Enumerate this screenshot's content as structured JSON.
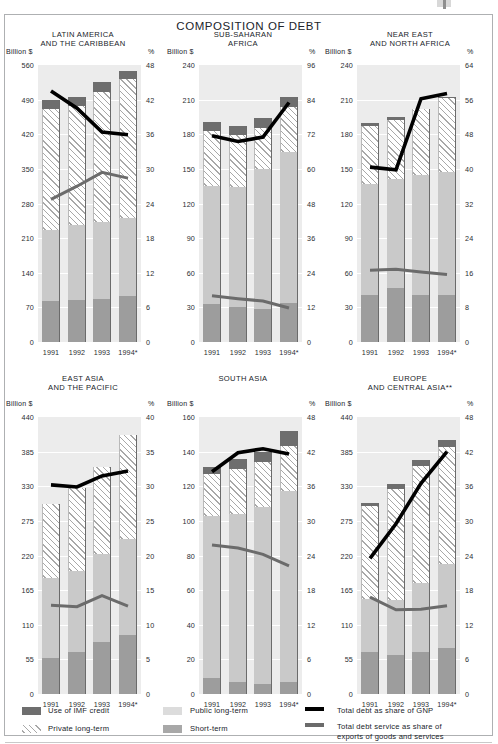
{
  "document": {
    "title": "COMPOSITION OF DEBT"
  },
  "legend": {
    "items": [
      {
        "key": "imf",
        "label": "Use of IMF credit",
        "swatch": "imf-swatch"
      },
      {
        "key": "priv",
        "label": "Private long-term",
        "swatch": "private-longterm-swatch"
      },
      {
        "key": "pub",
        "label": "Public long-term",
        "swatch": "public-longterm-swatch"
      },
      {
        "key": "srt",
        "label": "Short-term",
        "swatch": "short-term-swatch"
      },
      {
        "key": "gnp",
        "label": "Total debt as share of GNP",
        "swatch": "black-line-swatch"
      },
      {
        "key": "svc",
        "label": "Total debt service as share of",
        "label2": "exports of goods and services",
        "swatch": "gray-line-swatch"
      }
    ]
  },
  "axis_titles": {
    "left": "Billion $",
    "right": "%"
  },
  "colors": {
    "imf": "#6e6e6e",
    "public_long_term": "#c9c9c9",
    "short_term": "#9d9d9d",
    "private_long_term_hatch": "#a8a8a8",
    "plot_background": "#ececec",
    "debt_gnp_line": "#000000",
    "debt_service_line": "#6b6b6b"
  },
  "chart_data": [
    {
      "type": "bar",
      "id": "latin-america",
      "title": "LATIN AMERICA\nAND THE CARIBBEAN",
      "title_lines": [
        "LATIN AMERICA",
        "AND THE CARIBBEAN"
      ],
      "categories": [
        "1991",
        "1992",
        "1993",
        "1994*"
      ],
      "xlabel": "",
      "ylabel": "Billion $",
      "ylabel_right": "%",
      "ylim": [
        0,
        560
      ],
      "yticks": [
        0,
        70,
        140,
        210,
        280,
        350,
        420,
        490,
        560
      ],
      "ylim_right": [
        0,
        48
      ],
      "yticks_right": [
        0,
        6,
        12,
        18,
        24,
        30,
        36,
        42,
        48
      ],
      "grid": true,
      "series": [
        {
          "name": "Short-term",
          "values": [
            82,
            85,
            87,
            93
          ]
        },
        {
          "name": "Public long-term",
          "values": [
            145,
            151,
            155,
            158
          ]
        },
        {
          "name": "Private long-term",
          "values": [
            245,
            242,
            264,
            280
          ]
        },
        {
          "name": "Use of IMF credit",
          "values": [
            18,
            18,
            19,
            17
          ]
        }
      ],
      "totals": [
        490,
        496,
        525,
        548
      ],
      "lines": [
        {
          "name": "Total debt as share of GNP",
          "axis": "right",
          "values": [
            43.5,
            40.5,
            36.4,
            35.9
          ]
        },
        {
          "name": "Total debt service as share of exports of goods and services",
          "axis": "right",
          "values": [
            24.7,
            27.0,
            29.4,
            28.4
          ]
        }
      ]
    },
    {
      "type": "bar",
      "id": "sub-saharan-africa",
      "title": "SUB-SAHARAN\nAFRICA",
      "title_lines": [
        "SUB-SAHARAN",
        "AFRICA"
      ],
      "categories": [
        "1991",
        "1992",
        "1993",
        "1994*"
      ],
      "xlabel": "",
      "ylabel": "Billion $",
      "ylabel_right": "%",
      "ylim": [
        0,
        240
      ],
      "yticks": [
        0,
        30,
        60,
        90,
        120,
        150,
        180,
        210,
        240
      ],
      "ylim_right": [
        0,
        96
      ],
      "yticks_right": [
        0,
        12,
        24,
        36,
        48,
        60,
        72,
        84,
        96
      ],
      "grid": true,
      "series": [
        {
          "name": "Short-term",
          "values": [
            33,
            30,
            29,
            34
          ]
        },
        {
          "name": "Public long-term",
          "values": [
            102,
            104,
            121,
            131
          ]
        },
        {
          "name": "Private long-term",
          "values": [
            48,
            45,
            35,
            39
          ]
        },
        {
          "name": "Use of IMF credit",
          "values": [
            8,
            8,
            9,
            8
          ]
        }
      ],
      "totals": [
        191,
        187,
        194,
        212
      ],
      "lines": [
        {
          "name": "Total debt as share of GNP",
          "axis": "right",
          "values": [
            71.5,
            69.5,
            71.0,
            83.0
          ]
        },
        {
          "name": "Total debt service as share of exports of goods and services",
          "axis": "right",
          "values": [
            16.0,
            15.0,
            14.2,
            11.8
          ]
        }
      ]
    },
    {
      "type": "bar",
      "id": "near-east-north-africa",
      "title": "NEAR EAST\nAND NORTH AFRICA",
      "title_lines": [
        "NEAR EAST",
        "AND NORTH AFRICA"
      ],
      "categories": [
        "1991",
        "1992",
        "1993",
        "1994*"
      ],
      "xlabel": "",
      "ylabel": "Billion $",
      "ylabel_right": "%",
      "ylim": [
        0,
        240
      ],
      "yticks": [
        0,
        30,
        60,
        90,
        120,
        150,
        180,
        210,
        240
      ],
      "ylim_right": [
        0,
        64
      ],
      "yticks_right": [
        0,
        8,
        16,
        24,
        32,
        40,
        48,
        56,
        64
      ],
      "grid": true,
      "series": [
        {
          "name": "Short-term",
          "values": [
            41,
            47,
            41,
            41
          ]
        },
        {
          "name": "Public long-term",
          "values": [
            96,
            94,
            104,
            106
          ]
        },
        {
          "name": "Private long-term",
          "values": [
            50,
            51,
            57,
            64
          ]
        },
        {
          "name": "Use of IMF credit",
          "values": [
            3,
            3,
            0,
            1
          ]
        }
      ],
      "totals": [
        190,
        195,
        202,
        212
      ],
      "lines": [
        {
          "name": "Total debt as share of GNP",
          "axis": "right",
          "values": [
            40.4,
            39.8,
            56.2,
            57.4
          ]
        },
        {
          "name": "Total debt service as share of exports of goods and services",
          "axis": "right",
          "values": [
            16.6,
            16.8,
            16.2,
            15.6
          ]
        }
      ]
    },
    {
      "type": "bar",
      "id": "east-asia-pacific",
      "title": "EAST ASIA\nAND THE PACIFIC",
      "title_lines": [
        "EAST ASIA",
        "AND THE PACIFIC"
      ],
      "categories": [
        "1991",
        "1992",
        "1993",
        "1994*"
      ],
      "xlabel": "",
      "ylabel": "Billion $",
      "ylabel_right": "%",
      "ylim": [
        0,
        440
      ],
      "yticks": [
        0,
        55,
        110,
        165,
        220,
        275,
        330,
        385,
        440
      ],
      "ylim_right": [
        0,
        40
      ],
      "yticks_right": [
        0,
        5,
        10,
        15,
        20,
        25,
        30,
        35,
        40
      ],
      "grid": true,
      "series": [
        {
          "name": "Short-term",
          "values": [
            57,
            66,
            82,
            94
          ]
        },
        {
          "name": "Public long-term",
          "values": [
            127,
            130,
            141,
            152
          ]
        },
        {
          "name": "Private long-term",
          "values": [
            118,
            131,
            137,
            165
          ]
        },
        {
          "name": "Use of IMF credit",
          "values": [
            0,
            0,
            0,
            0
          ]
        }
      ],
      "totals": [
        302,
        327,
        360,
        411
      ],
      "lines": [
        {
          "name": "Total debt as share of GNP",
          "axis": "right",
          "values": [
            30.2,
            29.9,
            31.5,
            32.2
          ]
        },
        {
          "name": "Total debt service as share of exports of goods and services",
          "axis": "right",
          "values": [
            12.8,
            12.6,
            14.2,
            12.7
          ]
        }
      ]
    },
    {
      "type": "bar",
      "id": "south-asia",
      "title": "SOUTH ASIA",
      "title_lines": [
        "SOUTH ASIA"
      ],
      "categories": [
        "1991",
        "1992",
        "1993",
        "1994*"
      ],
      "xlabel": "",
      "ylabel": "Billion $",
      "ylabel_right": "%",
      "ylim": [
        0,
        160
      ],
      "yticks": [
        0,
        20,
        40,
        60,
        80,
        100,
        120,
        140,
        160
      ],
      "ylim_right": [
        0,
        48
      ],
      "yticks_right": [
        0,
        6,
        12,
        18,
        24,
        30,
        36,
        42,
        48
      ],
      "grid": true,
      "series": [
        {
          "name": "Short-term",
          "values": [
            9,
            7,
            6,
            7
          ]
        },
        {
          "name": "Public long-term",
          "values": [
            94,
            97,
            102,
            110
          ]
        },
        {
          "name": "Private long-term",
          "values": [
            24,
            26,
            26,
            26
          ]
        },
        {
          "name": "Use of IMF credit",
          "values": [
            4,
            6,
            6,
            9
          ]
        }
      ],
      "totals": [
        131,
        136,
        140,
        152
      ],
      "lines": [
        {
          "name": "Total debt as share of GNP",
          "axis": "right",
          "values": [
            38.5,
            41.8,
            42.5,
            41.6
          ]
        },
        {
          "name": "Total debt service as share of exports of goods and services",
          "axis": "right",
          "values": [
            25.8,
            25.3,
            24.2,
            22.2
          ]
        }
      ]
    },
    {
      "type": "bar",
      "id": "europe-central-asia",
      "title": "EUROPE\nAND CENTRAL ASIA**",
      "title_lines": [
        "EUROPE",
        "AND CENTRAL ASIA**"
      ],
      "categories": [
        "1991",
        "1992",
        "1993",
        "1994*"
      ],
      "xlabel": "",
      "ylabel": "Billion $",
      "ylabel_right": "%",
      "ylim": [
        0,
        440
      ],
      "yticks": [
        0,
        55,
        110,
        165,
        220,
        275,
        330,
        385,
        440
      ],
      "ylim_right": [
        0,
        48
      ],
      "yticks_right": [
        0,
        6,
        12,
        18,
        24,
        30,
        36,
        42,
        48
      ],
      "grid": true,
      "series": [
        {
          "name": "Short-term",
          "values": [
            66,
            62,
            66,
            73
          ]
        },
        {
          "name": "Public long-term",
          "values": [
            85,
            88,
            110,
            133
          ]
        },
        {
          "name": "Private long-term",
          "values": [
            148,
            175,
            186,
            186
          ]
        },
        {
          "name": "Use of IMF credit",
          "values": [
            5,
            8,
            9,
            11
          ]
        }
      ],
      "totals": [
        304,
        333,
        371,
        403
      ],
      "lines": [
        {
          "name": "Total debt as share of GNP",
          "axis": "right",
          "values": [
            23.5,
            29.5,
            36.5,
            42.0
          ]
        },
        {
          "name": "Total debt service as share of exports of goods and services",
          "axis": "right",
          "values": [
            16.8,
            14.6,
            14.7,
            15.3
          ]
        }
      ]
    }
  ]
}
